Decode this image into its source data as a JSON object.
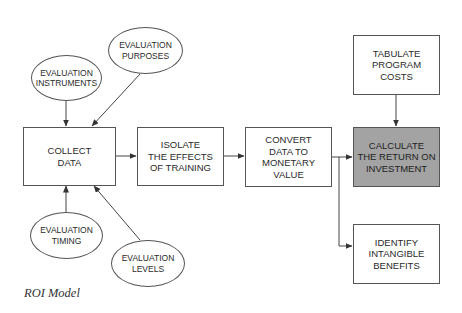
{
  "diagram": {
    "caption": "ROI Model",
    "colors": {
      "shaded_box": "#a3a3a3",
      "stroke": "#555555",
      "text": "#2a2a2a"
    },
    "boxes": {
      "collect": "COLLECT\nDATA",
      "isolate": "ISOLATE\nTHE EFFECTS\nOF TRAINING",
      "convert": "CONVERT\nDATA TO\nMONETARY\nVALUE",
      "calculate": "CALCULATE\nTHE RETURN ON\nINVESTMENT",
      "tabulate": "TABULATE\nPROGRAM\nCOSTS",
      "identify": "IDENTIFY\nINTANGIBLE\nBENEFITS"
    },
    "ellipses": {
      "instruments": "EVALUATION\nINSTRUMENTS",
      "purposes": "EVALUATION\nPURPOSES",
      "timing": "EVALUATION\nTIMING",
      "levels": "EVALUATION\nLEVELS"
    },
    "edges": [
      {
        "from": "instruments",
        "to": "collect"
      },
      {
        "from": "purposes",
        "to": "collect"
      },
      {
        "from": "timing",
        "to": "collect"
      },
      {
        "from": "levels",
        "to": "collect"
      },
      {
        "from": "collect",
        "to": "isolate"
      },
      {
        "from": "isolate",
        "to": "convert"
      },
      {
        "from": "convert",
        "to": "calculate"
      },
      {
        "from": "convert",
        "to": "identify"
      },
      {
        "from": "tabulate",
        "to": "calculate"
      }
    ]
  }
}
